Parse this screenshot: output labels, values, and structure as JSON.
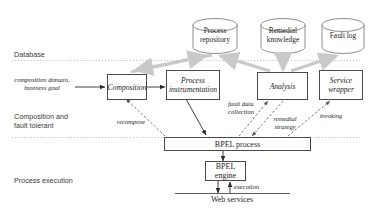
{
  "diagram": {
    "colors": {
      "stroke": "#4a4a4a",
      "gray_arrow": "#c9c9c9",
      "dashed": "#7a7a7a",
      "divider": "#b9b9b9",
      "text": "#1d1d1d",
      "layer_text": "#3a3a3a"
    },
    "layers": [
      {
        "id": "database",
        "label": "Database"
      },
      {
        "id": "composition-fault-tolerant",
        "label": "Composition and\nfault tolerant"
      },
      {
        "id": "process-execution",
        "label": "Process execution"
      }
    ],
    "datastores": [
      {
        "id": "process-repository",
        "label": "Process\nrepository"
      },
      {
        "id": "remedial-knowledge",
        "label": "Remedial\nknowledge"
      },
      {
        "id": "fault-log",
        "label": "Fault log"
      }
    ],
    "nodes": [
      {
        "id": "composition",
        "label": "Composition",
        "style": "italic"
      },
      {
        "id": "process-instrumentation",
        "label": "Process\ninstrumentation",
        "style": "italic"
      },
      {
        "id": "analysis",
        "label": "Analysis",
        "style": "italic"
      },
      {
        "id": "service-wrapper",
        "label": "Service\nwrapper",
        "style": "italic"
      },
      {
        "id": "bpel-process",
        "label": "BPEL process",
        "style": "plain"
      },
      {
        "id": "bpel-engine",
        "label": "BPEL\nengine",
        "style": "plain"
      }
    ],
    "free_text": [
      {
        "id": "web-services",
        "label": "Web services"
      }
    ],
    "edge_labels": [
      {
        "id": "input-goal",
        "label": "composition domain,\nbusiness goal"
      },
      {
        "id": "recompose",
        "label": "recompose"
      },
      {
        "id": "fault-data-collection",
        "label": "fault data\ncollection"
      },
      {
        "id": "remedial-strategy",
        "label": "remedial\nstrategy"
      },
      {
        "id": "invoking",
        "label": "invoking"
      },
      {
        "id": "execution",
        "label": "execution"
      }
    ]
  }
}
